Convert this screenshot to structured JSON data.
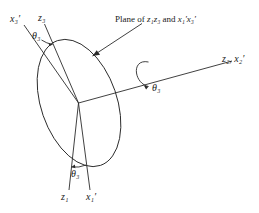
{
  "figure": {
    "type": "3d-rotation-euler-angle-diagram",
    "background_color": "#ffffff",
    "stroke_color": "#2b2b2b",
    "labels": {
      "x3_prime": "x₃′",
      "z3": "z₃",
      "theta3_upper": "θ₃",
      "theta3_rotation": "θ₃",
      "theta3_lower": "θ₃",
      "z2_x2_prime": "z₂, x₂′",
      "z1": "z₁",
      "x1_prime": "x₁′",
      "plane_caption": "Plane of z₁z₃ and x₁′x₃′"
    },
    "caption_parts": {
      "prefix": "Plane of ",
      "first_plane": "z₁z₃",
      "conjunction": " and ",
      "second_plane": "x₁′x₃′"
    },
    "elements": {
      "disk_name": "rotation-plane-ellipse",
      "pointer_name": "caption-pointer-arrow",
      "rotation_arrow_name": "rotation-direction-arrow"
    }
  }
}
